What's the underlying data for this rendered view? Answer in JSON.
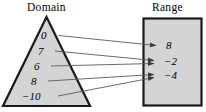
{
  "diagram": {
    "type": "mapping-diagram",
    "domain": {
      "label": "Domain",
      "shape": "triangle",
      "fill_color": "#d4d4d4",
      "stroke_color": "#1a1a1a",
      "values": [
        "0",
        "7",
        "6",
        "8",
        "−10"
      ]
    },
    "range": {
      "label": "Range",
      "shape": "rectangle",
      "fill_color": "#d4d4d4",
      "stroke_color": "#1a1a1a",
      "values": [
        "8",
        "−2",
        "−4"
      ]
    },
    "arrows": [
      {
        "from": "0",
        "to": "8"
      },
      {
        "from": "7",
        "to": "−2"
      },
      {
        "from": "6",
        "to": "−2"
      },
      {
        "from": "8",
        "to": "−4"
      },
      {
        "from": "−10",
        "to": "−4"
      }
    ],
    "arrow_color": "#4a4a4a"
  }
}
